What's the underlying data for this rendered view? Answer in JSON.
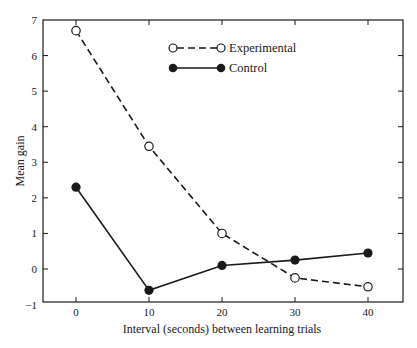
{
  "chart_data": {
    "type": "line",
    "title": "",
    "xlabel": "Interval (seconds) between learning trials",
    "ylabel": "Mean gain",
    "x": [
      0,
      10,
      20,
      30,
      40
    ],
    "xticks": [
      "0",
      "10",
      "20",
      "30",
      "40"
    ],
    "yticks": [
      "-1",
      "0",
      "1",
      "2",
      "3",
      "4",
      "5",
      "6",
      "7"
    ],
    "xlim": [
      -4.5,
      44.5
    ],
    "ylim": [
      -1,
      7
    ],
    "grid": false,
    "legend_position": "upper center",
    "series": [
      {
        "name": "Experimental",
        "values": [
          6.7,
          3.45,
          1.0,
          -0.25,
          -0.5
        ],
        "marker": "open-circle",
        "line_style": "dashed",
        "color": "#1a1a1a"
      },
      {
        "name": "Control",
        "values": [
          2.3,
          -0.6,
          0.1,
          0.25,
          0.45
        ],
        "marker": "filled-circle",
        "line_style": "solid",
        "color": "#1a1a1a"
      }
    ]
  },
  "legend": {
    "items": [
      {
        "label": "Experimental"
      },
      {
        "label": "Control"
      }
    ]
  },
  "axes": {
    "xlabel": "Interval (seconds) between learning trials",
    "ylabel": "Mean gain"
  }
}
